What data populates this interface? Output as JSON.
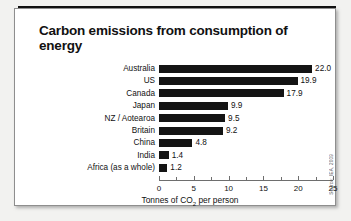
{
  "figure": {
    "title": "Carbon emissions from consumption of energy",
    "source": "Source: IEA, 2009"
  },
  "chart_data": {
    "type": "bar",
    "orientation": "horizontal",
    "title": "Carbon emissions from consumption of energy",
    "subtitle": "",
    "xlabel": "Tonnes of CO₂ per person",
    "ylabel": "",
    "xlim": [
      0,
      25
    ],
    "xticks": [
      0,
      5,
      10,
      15,
      20,
      25
    ],
    "xtick_labels": [
      "0",
      "5",
      "10",
      "15",
      "20",
      "25"
    ],
    "minor_xticks": [
      2.5,
      7.5,
      12.5,
      17.5,
      22.5
    ],
    "grid": false,
    "legend": false,
    "bar_color": "#141414",
    "categories": [
      "Australia",
      "US",
      "Canada",
      "Japan",
      "NZ / Aotearoa",
      "Britain",
      "China",
      "India",
      "Africa (as a whole)"
    ],
    "values": [
      22.0,
      19.9,
      17.9,
      9.9,
      9.5,
      9.2,
      4.8,
      1.4,
      1.2
    ],
    "value_labels": [
      "22.0",
      "19.9",
      "17.9",
      "9.9",
      "9.5",
      "9.2",
      "4.8",
      "1.4",
      "1.2"
    ]
  }
}
